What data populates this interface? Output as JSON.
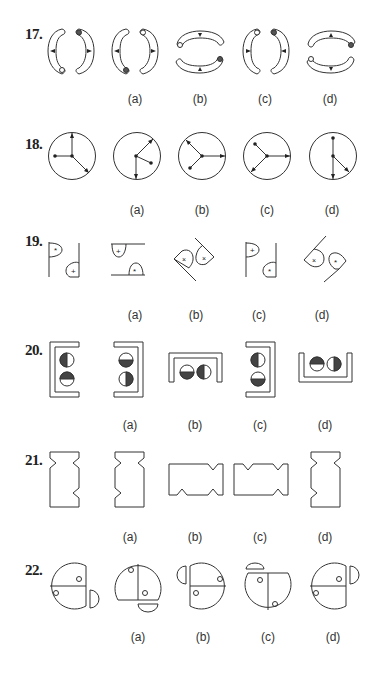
{
  "questions": [
    {
      "number": "17.",
      "options": [
        "(a)",
        "(b)",
        "(c)",
        "(d)"
      ]
    },
    {
      "number": "18.",
      "options": [
        "(a)",
        "(b)",
        "(c)",
        "(d)"
      ]
    },
    {
      "number": "19.",
      "options": [
        "(a)",
        "(b)",
        "(c)",
        "(d)"
      ]
    },
    {
      "number": "20.",
      "options": [
        "(a)",
        "(b)",
        "(c)",
        "(d)"
      ]
    },
    {
      "number": "21.",
      "options": [
        "(a)",
        "(b)",
        "(c)",
        "(d)"
      ]
    },
    {
      "number": "22.",
      "options": [
        "(a)",
        "(b)",
        "(c)",
        "(d)"
      ]
    }
  ],
  "colors": {
    "stroke": "#333333",
    "fill_dark": "#444444",
    "background": "#ffffff"
  }
}
